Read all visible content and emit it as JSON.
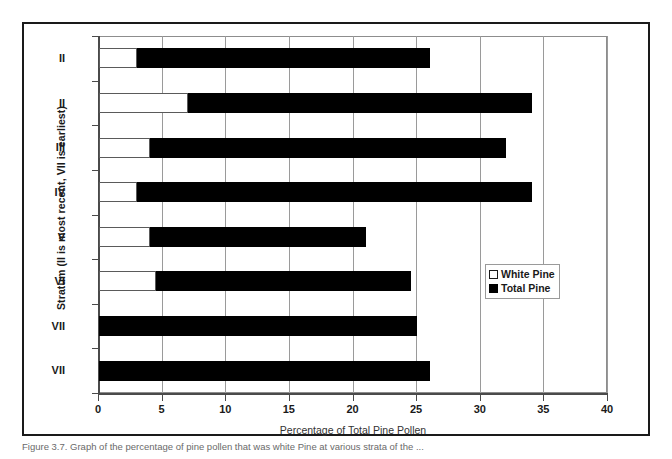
{
  "chart_data": {
    "type": "bar",
    "orientation": "horizontal",
    "title": "",
    "xlabel": "Percentage of Total Pine Pollen",
    "ylabel": "Stratum (II is most recent, VII is earliest)",
    "xlim": [
      0,
      40
    ],
    "xticks": [
      0,
      5,
      10,
      15,
      20,
      25,
      30,
      35,
      40
    ],
    "categories": [
      "II",
      "II",
      "III",
      "IV",
      "V",
      "VI",
      "VII",
      "VII"
    ],
    "grid": "vertical",
    "legend_position": "middle-right",
    "series": [
      {
        "name": "Total Pine",
        "color": "#000000",
        "values": [
          26.0,
          34.0,
          32.0,
          34.0,
          21.0,
          24.5,
          25.0,
          26.0
        ]
      },
      {
        "name": "White Pine",
        "color": "#ffffff",
        "values": [
          3.0,
          7.0,
          4.0,
          3.0,
          4.0,
          4.5,
          0.0,
          0.0
        ]
      }
    ]
  },
  "legend": {
    "items": [
      {
        "label": "White Pine",
        "swatch": "white-square"
      },
      {
        "label": "Total Pine",
        "swatch": "black-square"
      }
    ]
  },
  "caption": {
    "text": "Figure 3.7. Graph of the percentage of pine pollen that was white Pine at various strata of the ..."
  }
}
